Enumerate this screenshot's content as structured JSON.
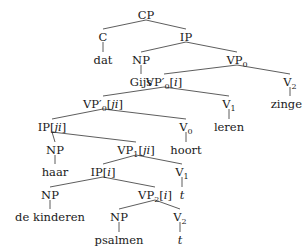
{
  "tree": {
    "nodes": [
      {
        "id": "CP",
        "label": "CP",
        "x": 146,
        "y": 15
      },
      {
        "id": "C",
        "label": "C",
        "x": 103,
        "y": 37
      },
      {
        "id": "dat",
        "label": "dat",
        "x": 103,
        "y": 60,
        "leaf": true
      },
      {
        "id": "IP",
        "label": "IP",
        "x": 186,
        "y": 37
      },
      {
        "id": "NP1",
        "label": "NP",
        "x": 141,
        "y": 60
      },
      {
        "id": "Gijs",
        "label": "Gijs",
        "x": 141,
        "y": 82,
        "leaf": true
      },
      {
        "id": "VP0",
        "label": "VP",
        "sub": "0",
        "x": 237,
        "y": 60
      },
      {
        "id": "VPp0i",
        "label": "VP′",
        "sub": "0",
        "bracket": "[i]",
        "x": 164,
        "y": 82
      },
      {
        "id": "V2a",
        "label": "V",
        "sub": "2",
        "x": 290,
        "y": 82
      },
      {
        "id": "zingen",
        "label": "zingen",
        "x": 290,
        "y": 104,
        "leaf": true
      },
      {
        "id": "VPp0ji",
        "label": "VP′",
        "sub": "0",
        "bracket": "[ji]",
        "x": 103,
        "y": 104
      },
      {
        "id": "V1a",
        "label": "V",
        "sub": "1",
        "x": 229,
        "y": 104
      },
      {
        "id": "leren",
        "label": "leren",
        "x": 229,
        "y": 127,
        "leaf": true
      },
      {
        "id": "IPji",
        "label": "IP",
        "bracket": "[ji]",
        "x": 52,
        "y": 127
      },
      {
        "id": "V0",
        "label": "V",
        "sub": "0",
        "x": 186,
        "y": 127
      },
      {
        "id": "hoort",
        "label": "hoort",
        "x": 186,
        "y": 150,
        "leaf": true
      },
      {
        "id": "NP2",
        "label": "NP",
        "x": 55,
        "y": 150
      },
      {
        "id": "haar",
        "label": "haar",
        "x": 55,
        "y": 172,
        "leaf": true
      },
      {
        "id": "VP1ji",
        "label": "VP",
        "sub": "1",
        "bracket": "[ji]",
        "x": 136,
        "y": 150
      },
      {
        "id": "IPi",
        "label": "IP",
        "bracket": "[i]",
        "x": 103,
        "y": 172
      },
      {
        "id": "V1b",
        "label": "V",
        "sub": "1",
        "x": 182,
        "y": 172
      },
      {
        "id": "t1",
        "label": "t",
        "x": 182,
        "y": 195,
        "leaf": true,
        "italic": true
      },
      {
        "id": "NP3",
        "label": "NP",
        "x": 50,
        "y": 195
      },
      {
        "id": "dekinderen",
        "label": "de kinderen",
        "x": 50,
        "y": 217,
        "leaf": true
      },
      {
        "id": "VP2i",
        "label": "VP",
        "sub": "2",
        "bracket": "[i]",
        "x": 155,
        "y": 195
      },
      {
        "id": "NP4",
        "label": "NP",
        "x": 119,
        "y": 217
      },
      {
        "id": "psalmen",
        "label": "psalmen",
        "x": 119,
        "y": 240,
        "leaf": true
      },
      {
        "id": "V2b",
        "label": "V",
        "sub": "2",
        "x": 180,
        "y": 217
      },
      {
        "id": "t2",
        "label": "t",
        "x": 180,
        "y": 240,
        "leaf": true,
        "italic": true
      }
    ],
    "edges": [
      [
        "CP",
        "C"
      ],
      [
        "CP",
        "IP"
      ],
      [
        "C",
        "dat"
      ],
      [
        "IP",
        "NP1"
      ],
      [
        "IP",
        "VP0"
      ],
      [
        "NP1",
        "Gijs"
      ],
      [
        "VP0",
        "VPp0i"
      ],
      [
        "VP0",
        "V2a"
      ],
      [
        "V2a",
        "zingen"
      ],
      [
        "VPp0i",
        "VPp0ji"
      ],
      [
        "VPp0i",
        "V1a"
      ],
      [
        "V1a",
        "leren"
      ],
      [
        "VPp0ji",
        "IPji"
      ],
      [
        "VPp0ji",
        "V0"
      ],
      [
        "V0",
        "hoort"
      ],
      [
        "IPji",
        "NP2"
      ],
      [
        "IPji",
        "VP1ji"
      ],
      [
        "NP2",
        "haar"
      ],
      [
        "VP1ji",
        "IPi"
      ],
      [
        "VP1ji",
        "V1b"
      ],
      [
        "V1b",
        "t1"
      ],
      [
        "IPi",
        "NP3"
      ],
      [
        "IPi",
        "VP2i"
      ],
      [
        "NP3",
        "dekinderen"
      ],
      [
        "VP2i",
        "NP4"
      ],
      [
        "VP2i",
        "V2b"
      ],
      [
        "NP4",
        "psalmen"
      ],
      [
        "V2b",
        "t2"
      ]
    ]
  }
}
